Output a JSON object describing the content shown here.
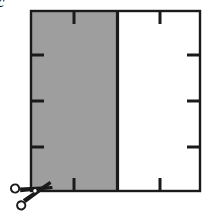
{
  "figure": {
    "label": "c",
    "caption_visible": false,
    "colors": {
      "shaded_fill": "#9e9e9e",
      "unshaded_fill": "#ffffff",
      "stroke": "#1a1a1a",
      "background": "#ffffff"
    },
    "rectangle": {
      "x": 31,
      "y": 11,
      "width": 169,
      "height": 180,
      "stroke_width": 2
    },
    "divider": {
      "name": "cut-line",
      "x": 117,
      "y_top": 11,
      "y_bottom": 191,
      "stroke_width": 3,
      "description": "vertical boundary between shaded and unshaded regions"
    },
    "shaded_region": {
      "name": "left-shaded-region",
      "x": 31,
      "y": 11,
      "width": 86,
      "height": 180,
      "fill": "#9e9e9e"
    },
    "unshaded_region": {
      "name": "right-unshaded-region",
      "x": 117,
      "y": 11,
      "width": 83,
      "height": 180,
      "fill": "#ffffff"
    },
    "ticks": {
      "top": [
        {
          "x": 74,
          "length": 13
        },
        {
          "x": 160,
          "length": 13
        }
      ],
      "bottom": [
        {
          "x": 74,
          "length": 13
        },
        {
          "x": 160,
          "length": 13
        }
      ],
      "left": [
        {
          "y": 55,
          "length": 13
        },
        {
          "y": 101,
          "length": 13
        },
        {
          "y": 147,
          "length": 13
        }
      ],
      "right": [
        {
          "y": 55,
          "length": 13
        },
        {
          "y": 101,
          "length": 13
        },
        {
          "y": 147,
          "length": 13
        }
      ],
      "stroke_width": 3
    },
    "scissors": {
      "name": "scissors-icon",
      "x": 8,
      "y": 186,
      "width": 44,
      "height": 26,
      "rotation_deg": -22,
      "meaning": "cut here"
    }
  }
}
